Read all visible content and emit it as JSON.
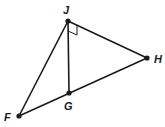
{
  "diagram": {
    "points": [
      {
        "id": "J",
        "label": "J",
        "x": 68,
        "y": 21,
        "lx": 63,
        "ly": 14
      },
      {
        "id": "H",
        "label": "H",
        "x": 147,
        "y": 58,
        "lx": 154,
        "ly": 63
      },
      {
        "id": "G",
        "label": "G",
        "x": 69,
        "y": 93,
        "lx": 64,
        "ly": 110
      },
      {
        "id": "F",
        "label": "F",
        "x": 19,
        "y": 116,
        "lx": 4,
        "ly": 121
      }
    ],
    "segments": [
      "JF",
      "JG",
      "JH",
      "FH"
    ],
    "right_angle_at": "J",
    "right_angle_between": [
      "JG",
      "JH"
    ]
  }
}
